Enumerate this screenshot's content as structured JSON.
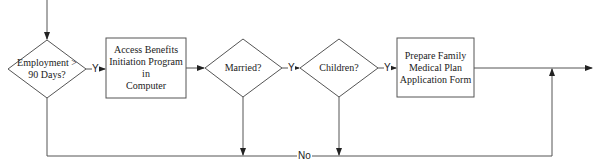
{
  "diagram": {
    "type": "flowchart",
    "nodes": [
      {
        "id": "d1",
        "shape": "diamond",
        "label": "Employment > 90 Days?",
        "line1": "Employment >",
        "line2": "90 Days?"
      },
      {
        "id": "p1",
        "shape": "rect",
        "label": "Access Benefits Initiation Program in Computer",
        "line1": "Access Benefits",
        "line2": "Initiation Program in",
        "line3": "Computer"
      },
      {
        "id": "d2",
        "shape": "diamond",
        "label": "Married?"
      },
      {
        "id": "d3",
        "shape": "diamond",
        "label": "Children?"
      },
      {
        "id": "p2",
        "shape": "rect",
        "label": "Prepare Family Medical Plan Application Form",
        "line1": "Prepare Family",
        "line2": "Medical Plan",
        "line3": "Application Form"
      }
    ],
    "edges": [
      {
        "from": "start",
        "to": "d1",
        "label": ""
      },
      {
        "from": "d1",
        "to": "p1",
        "label": "Y"
      },
      {
        "from": "p1",
        "to": "d2",
        "label": ""
      },
      {
        "from": "d2",
        "to": "d3",
        "label": "Y"
      },
      {
        "from": "d3",
        "to": "p2",
        "label": "Y"
      },
      {
        "from": "p2",
        "to": "end",
        "label": ""
      },
      {
        "from": "d1",
        "to": "end",
        "label": "No"
      },
      {
        "from": "d2",
        "to": "end",
        "label": "No"
      },
      {
        "from": "d3",
        "to": "end",
        "label": "No"
      }
    ],
    "yes_label": "Y",
    "no_label": "No",
    "line_color": "#555555"
  }
}
